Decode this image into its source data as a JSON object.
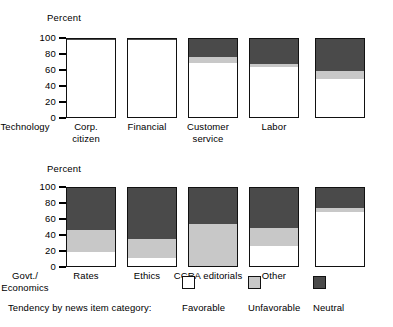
{
  "colors": {
    "favorable": "#ffffff",
    "unfavorable": "#c8c8c8",
    "neutral": "#4a4a4a",
    "outline": "#111111",
    "text": "#000000"
  },
  "charts": {
    "top": {
      "axis_title": "Percent",
      "yticks": [
        "100",
        "80",
        "60",
        "40",
        "20",
        "0"
      ]
    },
    "bottom": {
      "axis_title": "Percent",
      "yticks": [
        "100",
        "80",
        "60",
        "40",
        "20",
        "0"
      ]
    }
  },
  "legend": {
    "caption": "Tendency by news item category:",
    "items": [
      {
        "label": "Favorable",
        "color": "#ffffff",
        "swatch": "favorable-swatch"
      },
      {
        "label": "Unfavorable",
        "color": "#c8c8c8",
        "swatch": "unfavorable-swatch"
      },
      {
        "label": "Neutral",
        "color": "#4a4a4a",
        "swatch": "neutral-swatch"
      }
    ]
  },
  "chart_data": [
    {
      "type": "bar",
      "stacked": true,
      "title": "",
      "xlabel": "",
      "ylabel": "Percent",
      "ylim": [
        0,
        100
      ],
      "yticks": [
        0,
        20,
        40,
        60,
        80,
        100
      ],
      "grid": false,
      "legend_position": "bottom",
      "categories": [
        "Technology",
        "Corp. citizen",
        "Financial",
        "Customer service",
        "Labor"
      ],
      "series": [
        {
          "name": "Favorable",
          "color": "#ffffff",
          "values": [
            96,
            96,
            68,
            62,
            47
          ]
        },
        {
          "name": "Unfavorable",
          "color": "#c8c8c8",
          "values": [
            0,
            0,
            7,
            4,
            10
          ]
        },
        {
          "name": "Neutral",
          "color": "#4a4a4a",
          "values": [
            4,
            4,
            25,
            34,
            43
          ]
        }
      ]
    },
    {
      "type": "bar",
      "stacked": true,
      "title": "",
      "xlabel": "",
      "ylabel": "Percent",
      "ylim": [
        0,
        100
      ],
      "yticks": [
        0,
        20,
        40,
        60,
        80,
        100
      ],
      "grid": false,
      "legend_position": "bottom",
      "categories": [
        "Govt./ Economics",
        "Rates",
        "Ethics",
        "CCRA editorials",
        "Other"
      ],
      "series": [
        {
          "name": "Favorable",
          "color": "#ffffff",
          "values": [
            18,
            10,
            0,
            25,
            68
          ]
        },
        {
          "name": "Unfavorable",
          "color": "#c8c8c8",
          "values": [
            27,
            24,
            52,
            22,
            5
          ]
        },
        {
          "name": "Neutral",
          "color": "#4a4a4a",
          "values": [
            55,
            66,
            48,
            53,
            27
          ]
        }
      ]
    }
  ],
  "xlabels": {
    "top": [
      {
        "line1": "Technology",
        "line2": ""
      },
      {
        "line1": "Corp.",
        "line2": "citizen"
      },
      {
        "line1": "Financial",
        "line2": ""
      },
      {
        "line1": "Customer",
        "line2": "service"
      },
      {
        "line1": "Labor",
        "line2": ""
      }
    ],
    "bottom": [
      {
        "line1": "Govt./",
        "line2": "Economics"
      },
      {
        "line1": "Rates",
        "line2": ""
      },
      {
        "line1": "Ethics",
        "line2": ""
      },
      {
        "line1": "CCRA editorials",
        "line2": ""
      },
      {
        "line1": "Other",
        "line2": ""
      }
    ]
  }
}
